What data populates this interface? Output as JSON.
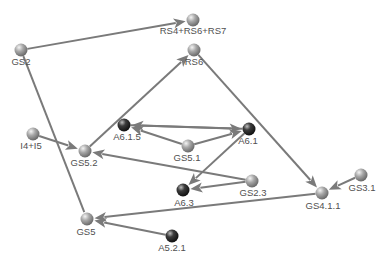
{
  "diagram": {
    "type": "directed-graph",
    "colors": {
      "edge": "#7a7a7a",
      "node_light": "#9a9a9a",
      "node_dark": "#2e2e2e",
      "label": "#505050",
      "background": "#ffffff"
    },
    "nodes": [
      {
        "id": "RS4+RS6+RS7",
        "label": "RS4+RS6+RS7",
        "x": 193,
        "y": 20,
        "style": "light",
        "lx": 193,
        "ly": 34
      },
      {
        "id": "GS2",
        "label": "GS2",
        "x": 21,
        "y": 50,
        "style": "light",
        "lx": 21,
        "ly": 65
      },
      {
        "id": "RS6",
        "label": "RS6",
        "x": 194,
        "y": 50,
        "style": "light",
        "lx": 194,
        "ly": 65
      },
      {
        "id": "I4+I5",
        "label": "I4+I5",
        "x": 33,
        "y": 134,
        "style": "light",
        "lx": 31,
        "ly": 149
      },
      {
        "id": "GS5.2",
        "label": "GS5.2",
        "x": 85,
        "y": 151,
        "style": "light",
        "lx": 84,
        "ly": 166
      },
      {
        "id": "A6.1.5",
        "label": "A6.1.5",
        "x": 124,
        "y": 125,
        "style": "dark",
        "lx": 127,
        "ly": 140
      },
      {
        "id": "A6.1",
        "label": "A6.1",
        "x": 249,
        "y": 129,
        "style": "dark",
        "lx": 248,
        "ly": 144
      },
      {
        "id": "GS5.1",
        "label": "GS5.1",
        "x": 188,
        "y": 146,
        "style": "light",
        "lx": 187,
        "ly": 161
      },
      {
        "id": "GS2.3",
        "label": "GS2.3",
        "x": 252,
        "y": 181,
        "style": "light",
        "lx": 253,
        "ly": 196
      },
      {
        "id": "A6.3",
        "label": "A6.3",
        "x": 183,
        "y": 190,
        "style": "dark",
        "lx": 184,
        "ly": 206
      },
      {
        "id": "GS4.1.1",
        "label": "GS4.1.1",
        "x": 322,
        "y": 193,
        "style": "light",
        "lx": 323,
        "ly": 209
      },
      {
        "id": "GS3.1",
        "label": "GS3.1",
        "x": 361,
        "y": 175,
        "style": "light",
        "lx": 362,
        "ly": 191
      },
      {
        "id": "GS5",
        "label": "GS5",
        "x": 87,
        "y": 219,
        "style": "light",
        "lx": 86,
        "ly": 235
      },
      {
        "id": "A5.2.1",
        "label": "A5.2.1",
        "x": 172,
        "y": 236,
        "style": "dark",
        "lx": 172,
        "ly": 251
      }
    ],
    "edges": [
      {
        "from": "GS2",
        "to": "RS4+RS6+RS7",
        "arrow": true
      },
      {
        "from": "GS2",
        "to": "GS5",
        "arrow": false
      },
      {
        "from": "GS5.2",
        "to": "RS6",
        "arrow": true
      },
      {
        "from": "RS6",
        "to": "GS4.1.1",
        "arrow": true
      },
      {
        "from": "I4+I5",
        "to": "GS5.2",
        "arrow": true
      },
      {
        "from": "A6.1.5",
        "to": "A6.1",
        "arrow": true
      },
      {
        "from": "A6.1",
        "to": "A6.1.5",
        "arrow": true
      },
      {
        "from": "GS5.1",
        "to": "A6.1.5",
        "arrow": true
      },
      {
        "from": "GS5.1",
        "to": "A6.1",
        "arrow": true
      },
      {
        "from": "A6.1",
        "to": "A6.3",
        "arrow": true
      },
      {
        "from": "GS2.3",
        "to": "A6.3",
        "arrow": true
      },
      {
        "from": "GS2.3",
        "to": "GS5.2",
        "arrow": true
      },
      {
        "from": "GS3.1",
        "to": "GS4.1.1",
        "arrow": true
      },
      {
        "from": "GS4.1.1",
        "to": "GS5",
        "arrow": true
      },
      {
        "from": "A5.2.1",
        "to": "GS5",
        "arrow": true
      }
    ]
  }
}
